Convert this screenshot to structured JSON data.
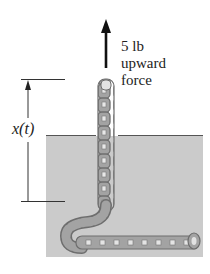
{
  "figure": {
    "type": "physics-diagram",
    "force_label": {
      "line1": "5 lb",
      "line2": "upward",
      "line3": "force"
    },
    "height_label": "x(t)",
    "colors": {
      "liquid": "#cbcbcb",
      "liquid_edge": "#8a8a8a",
      "chain_fill": "#9a9a9a",
      "chain_outline": "#6e6e6e",
      "line": "#333333"
    }
  }
}
